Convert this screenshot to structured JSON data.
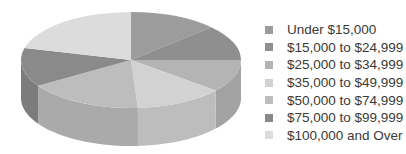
{
  "chart_data": {
    "type": "pie",
    "style": "3d",
    "title": "",
    "categories": [
      "Under $15,000",
      "$15,000 to $24,999",
      "$25,000 to $34,999",
      "$35,000 to $49,999",
      "$50,000 to $74,999",
      "$75,000 to $99,999",
      "$100,000 and Over"
    ],
    "values": [
      13,
      12,
      11,
      13,
      17,
      13,
      21
    ],
    "colors": [
      "#9c9c9c",
      "#8f8f8f",
      "#b4b4b4",
      "#d2d2d2",
      "#bdbdbd",
      "#8a8a8a",
      "#dcdcdc"
    ],
    "start_angle_deg": 0,
    "direction": "clockwise",
    "legend_position": "right"
  },
  "legend": {
    "items": [
      {
        "label": "Under $15,000",
        "color": "#9c9c9c"
      },
      {
        "label": "$15,000 to $24,999",
        "color": "#8f8f8f"
      },
      {
        "label": "$25,000 to $34,999",
        "color": "#b4b4b4"
      },
      {
        "label": "$35,000 to $49,999",
        "color": "#d2d2d2"
      },
      {
        "label": "$50,000 to $74,999",
        "color": "#bdbdbd"
      },
      {
        "label": "$75,000 to $99,999",
        "color": "#8a8a8a"
      },
      {
        "label": "$100,000 and Over",
        "color": "#dcdcdc"
      }
    ]
  }
}
